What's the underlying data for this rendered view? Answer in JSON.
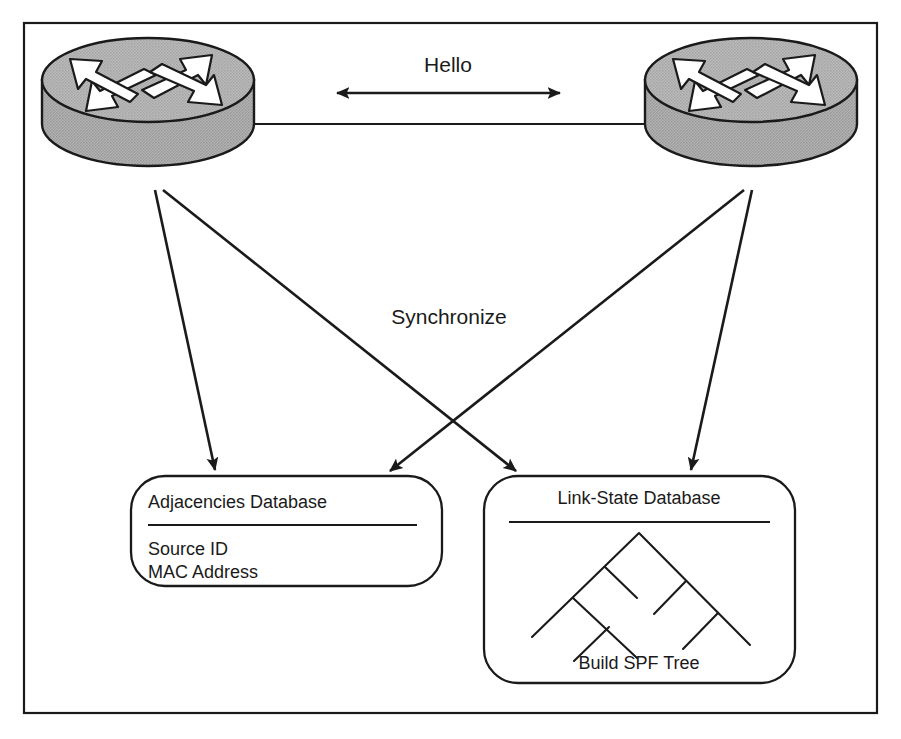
{
  "figure": {
    "kind": "network-protocol-diagram",
    "frame": {
      "stroke": "#1a1a1a"
    },
    "background": "#ffffff"
  },
  "palette": {
    "line": "#1a1a1a",
    "text": "#1a1a1a",
    "router_fill": "#a8a8a8",
    "router_top_fill": "#b0b0b0",
    "router_arrow_fill": "#ffffff",
    "box_fill": "#ffffff"
  },
  "nodes": {
    "router_left": {
      "name": "Router",
      "icon": "cisco-router-icon"
    },
    "router_right": {
      "name": "Router",
      "icon": "cisco-router-icon"
    }
  },
  "links": {
    "hello": {
      "label": "Hello",
      "direction": "bidirectional",
      "icon": "double-arrow-icon"
    },
    "synchronize": {
      "label": "Synchronize",
      "direction": "downward",
      "icon": "arrow-icon"
    }
  },
  "boxes": [
    {
      "id": "adjacencies-database",
      "title": "Adjacencies Database",
      "items": [
        "Source ID",
        "MAC Address"
      ],
      "footer": ""
    },
    {
      "id": "link-state-database",
      "title": "Link-State Database",
      "items": [],
      "footer": "Build SPF Tree",
      "graphic": "spf-tree-icon"
    }
  ]
}
